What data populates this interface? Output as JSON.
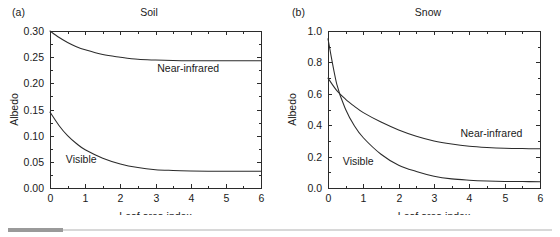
{
  "figure": {
    "footer_rule": {
      "accent_color": "#9a9a9a",
      "line_color": "#d8d8d8"
    }
  },
  "panel_a": {
    "label": "(a)",
    "title": "Soil",
    "xlabel": "Leaf area index",
    "ylabel": "Albedo",
    "xticks": [
      "0",
      "1",
      "2",
      "3",
      "4",
      "5",
      "6"
    ],
    "yticks": [
      "0.00",
      "0.05",
      "0.10",
      "0.15",
      "0.20",
      "0.25",
      "0.30"
    ],
    "series_labels": {
      "nir": "Near-infrared",
      "vis": "Visible"
    }
  },
  "panel_b": {
    "label": "(b)",
    "title": "Snow",
    "xlabel": "Leaf area index",
    "ylabel": "Albedo",
    "xticks": [
      "0",
      "1",
      "2",
      "3",
      "4",
      "5",
      "6"
    ],
    "yticks": [
      "0.0",
      "0.2",
      "0.4",
      "0.6",
      "0.8",
      "1.0"
    ],
    "series_labels": {
      "nir": "Near-infrared",
      "vis": "Visible"
    }
  },
  "chart_data": [
    {
      "type": "line",
      "id": "panel-a-soil",
      "title": "Soil",
      "panel_label": "(a)",
      "xlabel": "Leaf area index",
      "ylabel": "Albedo",
      "xlim": [
        0,
        6
      ],
      "ylim": [
        0.0,
        0.3
      ],
      "xticks": [
        0,
        1,
        2,
        3,
        4,
        5,
        6
      ],
      "yticks": [
        0.0,
        0.05,
        0.1,
        0.15,
        0.2,
        0.25,
        0.3
      ],
      "grid": false,
      "legend": "inline-annotations",
      "x": [
        0,
        0.25,
        0.5,
        0.75,
        1,
        1.5,
        2,
        2.5,
        3,
        3.5,
        4,
        4.5,
        5,
        5.5,
        6
      ],
      "series": [
        {
          "name": "Near-infrared",
          "values": [
            0.3,
            0.288,
            0.278,
            0.27,
            0.264,
            0.255,
            0.25,
            0.246,
            0.2445,
            0.2435,
            0.243,
            0.243,
            0.243,
            0.243,
            0.243
          ],
          "label_x": 3.05,
          "label_y": 0.222
        },
        {
          "name": "Visible",
          "values": [
            0.145,
            0.12,
            0.1,
            0.085,
            0.073,
            0.057,
            0.046,
            0.039,
            0.035,
            0.0335,
            0.0325,
            0.032,
            0.032,
            0.032,
            0.032
          ],
          "label_x": 0.45,
          "label_y": 0.048
        }
      ]
    },
    {
      "type": "line",
      "id": "panel-b-snow",
      "title": "Snow",
      "panel_label": "(b)",
      "xlabel": "Leaf area index",
      "ylabel": "Albedo",
      "xlim": [
        0,
        6
      ],
      "ylim": [
        0.0,
        1.0
      ],
      "xticks": [
        0,
        1,
        2,
        3,
        4,
        5,
        6
      ],
      "yticks": [
        0.0,
        0.2,
        0.4,
        0.6,
        0.8,
        1.0
      ],
      "minor_yticks": [
        0.1,
        0.3,
        0.5,
        0.7,
        0.9
      ],
      "grid": false,
      "legend": "inline-annotations",
      "x": [
        0,
        0.25,
        0.5,
        0.75,
        1,
        1.5,
        2,
        2.5,
        3,
        3.5,
        4,
        4.5,
        5,
        5.5,
        6
      ],
      "series": [
        {
          "name": "Visible",
          "values": [
            0.95,
            0.66,
            0.5,
            0.395,
            0.32,
            0.215,
            0.145,
            0.105,
            0.075,
            0.058,
            0.05,
            0.045,
            0.042,
            0.041,
            0.04
          ],
          "label_x": 0.42,
          "label_y": 0.145
        },
        {
          "name": "Near-infrared",
          "values": [
            0.7,
            0.62,
            0.565,
            0.52,
            0.48,
            0.42,
            0.37,
            0.33,
            0.3,
            0.28,
            0.266,
            0.258,
            0.253,
            0.251,
            0.25
          ],
          "label_x": 3.75,
          "label_y": 0.325
        }
      ],
      "crossover": {
        "x": 0.35,
        "y": 0.58
      }
    }
  ]
}
